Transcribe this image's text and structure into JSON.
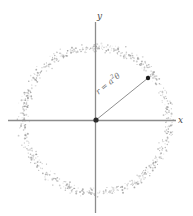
{
  "figure": {
    "axis_labels": {
      "x": "x",
      "y": "y"
    },
    "radius_label": {
      "lhs": "r",
      "equals": "=",
      "base": "a",
      "exponent": "2",
      "variable": "θ",
      "full": "r = a2θ"
    },
    "colors": {
      "background": "#ffffff",
      "axis": "#8c8c8c",
      "scatter": "#9a9a9a",
      "radius_line": "#8f8f8f",
      "marker": "#1a1a1a",
      "text": "#555555"
    }
  },
  "chart_data": {
    "type": "scatter",
    "title": "",
    "xlabel": "x",
    "ylabel": "y",
    "grid": false,
    "legend": null,
    "axis_ranges": {
      "xlim": [
        -1.3,
        1.35
      ],
      "ylim": [
        -1.35,
        1.35
      ]
    },
    "origin": {
      "x": 0,
      "y": 0
    },
    "ring": {
      "mean_radius": 1.0,
      "radial_noise": 0.07,
      "n_points": 700
    },
    "annotations": [
      {
        "text": "r = a2θ",
        "kind": "radius-label",
        "angle_deg": 39
      }
    ],
    "marked_point": {
      "r": 1.0,
      "theta_deg": 39,
      "x": 0.777,
      "y": 0.629
    },
    "radius_vector": {
      "from": [
        0,
        0
      ],
      "to": [
        0.777,
        0.629
      ],
      "length": 1.0
    },
    "series": [
      {
        "name": "ring scatter",
        "marker": "dot",
        "color": "#9a9a9a",
        "radius_mean": 1.0,
        "radius_spread": [
          0.9,
          1.1
        ]
      }
    ]
  }
}
